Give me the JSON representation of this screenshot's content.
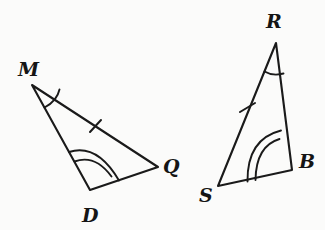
{
  "figure": {
    "background_color": "#fbfbfa",
    "ink_color": "#1a1a1a"
  },
  "triangles": [
    {
      "name": "triangle-MDQ",
      "vertices": [
        {
          "label": "M",
          "x": 32,
          "y": 85,
          "label_x": 18,
          "label_y": 76
        },
        {
          "label": "D",
          "x": 90,
          "y": 190,
          "label_x": 82,
          "label_y": 222
        },
        {
          "label": "Q",
          "x": 158,
          "y": 167,
          "label_x": 163,
          "label_y": 172
        }
      ],
      "path": "M 32 85 L 90 190 L 158 167 Z",
      "angle_marks": [
        {
          "vertex": "M",
          "arcs": 1,
          "name": "angle-arc-m"
        },
        {
          "vertex": "D",
          "arcs": 2,
          "name": "angle-arc-d"
        }
      ],
      "tick_marks": [
        {
          "side": "MQ",
          "count": 1,
          "name": "tick-mark-mq"
        }
      ]
    },
    {
      "name": "triangle-RSB",
      "vertices": [
        {
          "label": "R",
          "x": 276,
          "y": 43,
          "label_x": 266,
          "label_y": 26
        },
        {
          "label": "S",
          "x": 218,
          "y": 186,
          "label_x": 200,
          "label_y": 200
        },
        {
          "label": "B",
          "x": 292,
          "y": 170,
          "label_x": 299,
          "label_y": 166
        }
      ],
      "path": "M 276 43 L 218 186 L 292 170 Z",
      "angle_marks": [
        {
          "vertex": "R",
          "arcs": 1,
          "name": "angle-arc-r"
        },
        {
          "vertex": "S",
          "arcs": 2,
          "name": "angle-arc-s"
        }
      ],
      "tick_marks": [
        {
          "side": "SR",
          "count": 1,
          "name": "tick-mark-sr"
        }
      ]
    }
  ],
  "labels": {
    "m": "M",
    "d": "D",
    "q": "Q",
    "r": "R",
    "s": "S",
    "b": "B"
  }
}
